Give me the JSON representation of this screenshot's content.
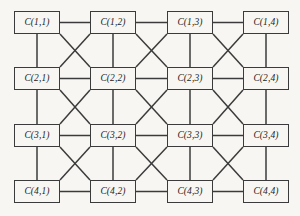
{
  "diagram": {
    "type": "grid-network",
    "title": "",
    "canvas": {
      "width": 300,
      "height": 216,
      "background": "#f7f6f2"
    },
    "style": {
      "line_color": "#3b3b3b",
      "box_fill": "#f7f6f2",
      "box_border_color": "#3b3b3b",
      "label_color": "#1d1d1d"
    },
    "geometry": {
      "rows": 4,
      "cols": 4,
      "box_width": 46,
      "box_height": 23,
      "col_x": [
        14,
        90,
        167,
        243
      ],
      "row_y": [
        11,
        67,
        124,
        180
      ]
    },
    "nodes": [
      {
        "id": "c-1-1",
        "row": 1,
        "col": 1,
        "label": "C(1,1)"
      },
      {
        "id": "c-1-2",
        "row": 1,
        "col": 2,
        "label": "C(1,2)"
      },
      {
        "id": "c-1-3",
        "row": 1,
        "col": 3,
        "label": "C(1,3)"
      },
      {
        "id": "c-1-4",
        "row": 1,
        "col": 4,
        "label": "C(1,4)"
      },
      {
        "id": "c-2-1",
        "row": 2,
        "col": 1,
        "label": "C(2,1)"
      },
      {
        "id": "c-2-2",
        "row": 2,
        "col": 2,
        "label": "C(2,2)"
      },
      {
        "id": "c-2-3",
        "row": 2,
        "col": 3,
        "label": "C(2,3)"
      },
      {
        "id": "c-2-4",
        "row": 2,
        "col": 4,
        "label": "C(2,4)"
      },
      {
        "id": "c-3-1",
        "row": 3,
        "col": 1,
        "label": "C(3,1)"
      },
      {
        "id": "c-3-2",
        "row": 3,
        "col": 2,
        "label": "C(3,2)"
      },
      {
        "id": "c-3-3",
        "row": 3,
        "col": 3,
        "label": "C(3,3)"
      },
      {
        "id": "c-3-4",
        "row": 3,
        "col": 4,
        "label": "C(3,4)"
      },
      {
        "id": "c-4-1",
        "row": 4,
        "col": 1,
        "label": "C(4,1)"
      },
      {
        "id": "c-4-2",
        "row": 4,
        "col": 2,
        "label": "C(4,2)"
      },
      {
        "id": "c-4-3",
        "row": 4,
        "col": 3,
        "label": "C(4,3)"
      },
      {
        "id": "c-4-4",
        "row": 4,
        "col": 4,
        "label": "C(4,4)"
      }
    ],
    "edges": {
      "horizontal": [
        [
          "c-1-1",
          "c-1-2"
        ],
        [
          "c-1-2",
          "c-1-3"
        ],
        [
          "c-1-3",
          "c-1-4"
        ],
        [
          "c-2-1",
          "c-2-2"
        ],
        [
          "c-2-2",
          "c-2-3"
        ],
        [
          "c-2-3",
          "c-2-4"
        ],
        [
          "c-3-1",
          "c-3-2"
        ],
        [
          "c-3-2",
          "c-3-3"
        ],
        [
          "c-3-3",
          "c-3-4"
        ],
        [
          "c-4-1",
          "c-4-2"
        ],
        [
          "c-4-2",
          "c-4-3"
        ],
        [
          "c-4-3",
          "c-4-4"
        ]
      ],
      "vertical": [
        [
          "c-1-1",
          "c-2-1"
        ],
        [
          "c-2-1",
          "c-3-1"
        ],
        [
          "c-3-1",
          "c-4-1"
        ],
        [
          "c-1-2",
          "c-2-2"
        ],
        [
          "c-2-2",
          "c-3-2"
        ],
        [
          "c-3-2",
          "c-4-2"
        ],
        [
          "c-1-3",
          "c-2-3"
        ],
        [
          "c-2-3",
          "c-3-3"
        ],
        [
          "c-3-3",
          "c-4-3"
        ],
        [
          "c-1-4",
          "c-2-4"
        ],
        [
          "c-2-4",
          "c-3-4"
        ],
        [
          "c-3-4",
          "c-4-4"
        ]
      ],
      "diagonal": [
        [
          "c-1-1",
          "c-2-2"
        ],
        [
          "c-1-2",
          "c-2-1"
        ],
        [
          "c-1-2",
          "c-2-3"
        ],
        [
          "c-1-3",
          "c-2-2"
        ],
        [
          "c-1-3",
          "c-2-4"
        ],
        [
          "c-1-4",
          "c-2-3"
        ],
        [
          "c-2-1",
          "c-3-2"
        ],
        [
          "c-2-2",
          "c-3-1"
        ],
        [
          "c-2-2",
          "c-3-3"
        ],
        [
          "c-2-3",
          "c-3-2"
        ],
        [
          "c-2-3",
          "c-3-4"
        ],
        [
          "c-2-4",
          "c-3-3"
        ],
        [
          "c-3-1",
          "c-4-2"
        ],
        [
          "c-3-2",
          "c-4-1"
        ],
        [
          "c-3-2",
          "c-4-3"
        ],
        [
          "c-3-3",
          "c-4-2"
        ],
        [
          "c-3-3",
          "c-4-4"
        ],
        [
          "c-3-4",
          "c-4-3"
        ]
      ]
    }
  }
}
